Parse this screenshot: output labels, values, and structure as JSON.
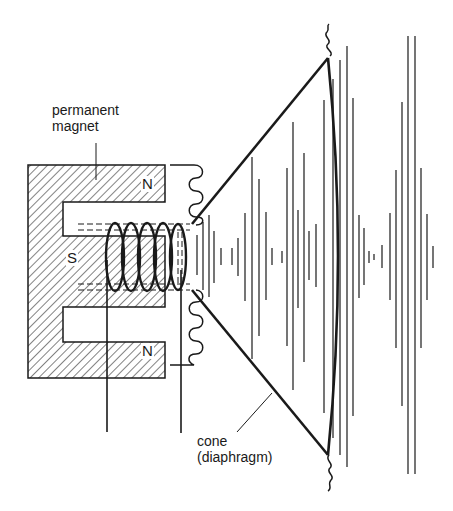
{
  "figure": {
    "labels": {
      "magnet_line1": "permanent",
      "magnet_line2": "magnet",
      "cone_line1": "cone",
      "cone_line2": "(diaphragm)"
    },
    "poles": {
      "north_top": "N",
      "south": "S",
      "north_bottom": "N"
    },
    "colors": {
      "ink": "#1a1a1a",
      "background": "#ffffff"
    }
  }
}
